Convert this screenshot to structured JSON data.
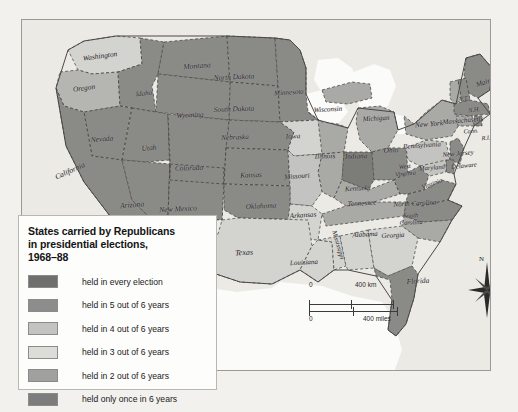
{
  "legend": {
    "title": "States carried by Republicans in presidential elections, 1968–88",
    "title_line1": "States carried by Republicans",
    "title_line2": "in presidential elections,",
    "title_line3": "1968–88",
    "items": [
      {
        "label": "held in every election",
        "color": "#6f6f6f",
        "count": 6
      },
      {
        "label": "held in 5 out of 6 years",
        "color": "#8d8d8d",
        "count": 5
      },
      {
        "label": "held in 4 out of 6 years",
        "color": "#c3c3c1",
        "count": 4
      },
      {
        "label": "held in 3 out of 6 years",
        "color": "#dcdcd9",
        "count": 3
      },
      {
        "label": "held in 2 out of 6 years",
        "color": "#a0a0a0",
        "count": 2
      },
      {
        "label": "held only once in 6 years",
        "color": "#7c7c7c",
        "count": 1
      }
    ]
  },
  "scale": {
    "km_zero": "0",
    "km_label": "400 km",
    "miles_zero": "0",
    "miles_label": "400 miles"
  },
  "compass": {
    "north_label": "N"
  },
  "map": {
    "water_color": "#fbfbfa",
    "background_color": "#eceae5",
    "border_color": "#6b6a67",
    "state_border_color": "#3d3c3a",
    "states": [
      {
        "name": "Washington",
        "label": "Washington",
        "x": 78,
        "y": 36,
        "size": 7.4,
        "rotate": -8,
        "shade": "#d3d3d0"
      },
      {
        "name": "Oregon",
        "label": "Oregon",
        "x": 62,
        "y": 68,
        "size": 7.4,
        "rotate": -7,
        "shade": "#b5b5b2"
      },
      {
        "name": "Idaho",
        "label": "Idaho",
        "x": 122,
        "y": 74,
        "size": 7.0,
        "rotate": -6,
        "shade": "#8a8a87"
      },
      {
        "name": "Montana",
        "label": "Montana",
        "x": 175,
        "y": 46,
        "size": 7.6,
        "rotate": -4,
        "shade": "#8a8a87"
      },
      {
        "name": "North Dakota",
        "label": "North Dakota",
        "x": 212,
        "y": 57,
        "size": 7.4,
        "rotate": -3,
        "shade": "#8a8a87"
      },
      {
        "name": "South Dakota",
        "label": "South Dakota",
        "x": 212,
        "y": 89,
        "size": 7.4,
        "rotate": -2,
        "shade": "#8a8a87"
      },
      {
        "name": "Minnesota",
        "label": "Minnesota",
        "x": 267,
        "y": 73,
        "size": 7.0,
        "rotate": -4,
        "shade": "#8a8a87"
      },
      {
        "name": "Wisconsin",
        "label": "Wisconsin",
        "x": 306,
        "y": 90,
        "size": 7.0,
        "rotate": -3,
        "shade": "#a9a9a6"
      },
      {
        "name": "Michigan",
        "label": "Michigan",
        "x": 354,
        "y": 99,
        "size": 7.0,
        "rotate": -3,
        "shade": "#a9a9a6"
      },
      {
        "name": "Wyoming",
        "label": "Wyoming",
        "x": 168,
        "y": 95,
        "size": 7.4,
        "rotate": -3,
        "shade": "#8a8a87"
      },
      {
        "name": "Nevada",
        "label": "Nevada",
        "x": 80,
        "y": 119,
        "size": 7.4,
        "rotate": -5,
        "shade": "#8a8a87"
      },
      {
        "name": "Utah",
        "label": "Utah",
        "x": 127,
        "y": 128,
        "size": 7.4,
        "rotate": -4,
        "shade": "#8a8a87"
      },
      {
        "name": "Nebraska",
        "label": "Nebraska",
        "x": 213,
        "y": 118,
        "size": 7.2,
        "rotate": -2,
        "shade": "#8a8a87"
      },
      {
        "name": "Iowa",
        "label": "Iowa",
        "x": 271,
        "y": 117,
        "size": 7.2,
        "rotate": -2,
        "shade": "#d3d3d0"
      },
      {
        "name": "Illinois",
        "label": "Illinois",
        "x": 303,
        "y": 137,
        "size": 7.2,
        "rotate": -2,
        "shade": "#a9a9a6"
      },
      {
        "name": "Indiana",
        "label": "Indiana",
        "x": 334,
        "y": 137,
        "size": 7.2,
        "rotate": -2,
        "shade": "#7c7c79"
      },
      {
        "name": "Ohio",
        "label": "Ohio",
        "x": 369,
        "y": 131,
        "size": 7.2,
        "rotate": -2,
        "shade": "#8a8a87"
      },
      {
        "name": "California",
        "label": "California",
        "x": 48,
        "y": 151,
        "size": 7.6,
        "rotate": -24,
        "shade": "#8a8a87"
      },
      {
        "name": "Colorado",
        "label": "Colorado",
        "x": 167,
        "y": 148,
        "size": 7.4,
        "rotate": -2,
        "shade": "#8a8a87"
      },
      {
        "name": "Kansas",
        "label": "Kansas",
        "x": 229,
        "y": 155,
        "size": 7.4,
        "rotate": -2,
        "shade": "#8a8a87"
      },
      {
        "name": "Missouri",
        "label": "Missouri",
        "x": 275,
        "y": 157,
        "size": 7.2,
        "rotate": -4,
        "shade": "#c3c3c1"
      },
      {
        "name": "Kentucky",
        "label": "Kentucky",
        "x": 336,
        "y": 169,
        "size": 7.0,
        "rotate": -3,
        "shade": "#a9a9a6"
      },
      {
        "name": "West Virginia",
        "label": "West\nVirginia",
        "x": 383,
        "y": 150,
        "size": 6.4,
        "rotate": -6,
        "shade": "#8a8a87"
      },
      {
        "name": "Virginia",
        "label": "Virginia",
        "x": 410,
        "y": 164,
        "size": 6.6,
        "rotate": -20,
        "shade": "#8a8a87"
      },
      {
        "name": "Arizona",
        "label": "Arizona",
        "x": 110,
        "y": 185,
        "size": 7.6,
        "rotate": -5,
        "shade": "#8a8a87"
      },
      {
        "name": "New Mexico",
        "label": "New Mexico",
        "x": 156,
        "y": 189,
        "size": 7.6,
        "rotate": -3,
        "shade": "#8a8a87"
      },
      {
        "name": "Oklahoma",
        "label": "Oklahoma",
        "x": 239,
        "y": 186,
        "size": 7.4,
        "rotate": -3,
        "shade": "#8a8a87"
      },
      {
        "name": "Arkansas",
        "label": "Arkansas",
        "x": 281,
        "y": 196,
        "size": 7.2,
        "rotate": -4,
        "shade": "#d3d3d0"
      },
      {
        "name": "Tennessee",
        "label": "Tennessee",
        "x": 340,
        "y": 184,
        "size": 7.2,
        "rotate": -3,
        "shade": "#a9a9a6"
      },
      {
        "name": "North Carolina",
        "label": "North Carolina",
        "x": 393,
        "y": 184,
        "size": 7.0,
        "rotate": -3,
        "shade": "#8a8a87"
      },
      {
        "name": "South Carolina",
        "label": "South\nCarolina",
        "x": 389,
        "y": 199,
        "size": 6.4,
        "rotate": -3,
        "shade": "#a9a9a6"
      },
      {
        "name": "Texas",
        "label": "Texas",
        "x": 222,
        "y": 233,
        "size": 8.0,
        "rotate": -3,
        "shade": "#d3d3d0"
      },
      {
        "name": "Louisiana",
        "label": "Louisiana",
        "x": 282,
        "y": 243,
        "size": 7.0,
        "rotate": -3,
        "shade": "#d3d3d0"
      },
      {
        "name": "Mississippi",
        "label": "Mississippi",
        "x": 316,
        "y": 225,
        "size": 6.6,
        "rotate": 74,
        "shade": "#d3d3d0"
      },
      {
        "name": "Alabama",
        "label": "Alabama",
        "x": 343,
        "y": 215,
        "size": 7.0,
        "rotate": -3,
        "shade": "#d3d3d0"
      },
      {
        "name": "Georgia",
        "label": "Georgia",
        "x": 371,
        "y": 216,
        "size": 7.0,
        "rotate": -3,
        "shade": "#d3d3d0"
      },
      {
        "name": "Florida",
        "label": "Florida",
        "x": 396,
        "y": 261,
        "size": 7.4,
        "rotate": -3,
        "shade": "#8a8a87"
      },
      {
        "name": "Pennsylvania",
        "label": "Pennsylvania",
        "x": 400,
        "y": 126,
        "size": 7.0,
        "rotate": -4,
        "shade": "#c3c3c1"
      },
      {
        "name": "New York",
        "label": "New York",
        "x": 407,
        "y": 104,
        "size": 7.4,
        "rotate": -4,
        "shade": "#a9a9a6"
      },
      {
        "name": "Maine",
        "label": "Maine",
        "x": 463,
        "y": 62,
        "size": 7.4,
        "rotate": -18,
        "shade": "#8a8a87"
      },
      {
        "name": "Vermont",
        "label": "V.T.",
        "x": 442,
        "y": 79,
        "size": 6.4,
        "rotate": -10,
        "shade": "#a9a9a6"
      },
      {
        "name": "New Hampshire",
        "label": "N.H.",
        "x": 452,
        "y": 90,
        "size": 6.4,
        "rotate": -6,
        "shade": "#8a8a87"
      },
      {
        "name": "Massachusetts",
        "label": "Massachusetts",
        "x": 441,
        "y": 101,
        "size": 7.0,
        "rotate": -5,
        "shade": "#8a8a87"
      },
      {
        "name": "Connecticut",
        "label": "Conn.",
        "x": 449,
        "y": 111,
        "size": 6.2,
        "rotate": -5,
        "shade": "#a9a9a6"
      },
      {
        "name": "Rhode Island",
        "label": "R.I.",
        "x": 464,
        "y": 118,
        "size": 6.2,
        "rotate": -5,
        "shade": "#8a8a87"
      },
      {
        "name": "New Jersey",
        "label": "New Jersey",
        "x": 436,
        "y": 134,
        "size": 6.8,
        "rotate": -5,
        "shade": "#8a8a87"
      },
      {
        "name": "Delaware",
        "label": "Delaware",
        "x": 442,
        "y": 146,
        "size": 6.6,
        "rotate": -5,
        "shade": "#8a8a87"
      },
      {
        "name": "Maryland",
        "label": "Maryland",
        "x": 410,
        "y": 148,
        "size": 6.6,
        "rotate": -5,
        "shade": "#c3c3c1"
      }
    ]
  }
}
